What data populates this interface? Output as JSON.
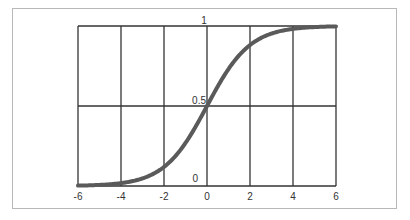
{
  "chart_data": {
    "type": "line",
    "title": "",
    "xlabel": "",
    "ylabel": "",
    "xlim": [
      -6,
      6
    ],
    "ylim": [
      0,
      1
    ],
    "grid": true,
    "x_ticks": [
      "-6",
      "-4",
      "-2",
      "0",
      "2",
      "4",
      "6"
    ],
    "y_ticks": [
      "0",
      "0.5",
      "1"
    ],
    "series": [
      {
        "name": "sigmoid",
        "function": "1/(1+exp(-x))",
        "x": [
          -6,
          -5,
          -4,
          -3,
          -2,
          -1,
          0,
          1,
          2,
          3,
          4,
          5,
          6
        ],
        "values": [
          0.002,
          0.007,
          0.018,
          0.047,
          0.119,
          0.269,
          0.5,
          0.731,
          0.881,
          0.953,
          0.982,
          0.993,
          0.998
        ]
      }
    ],
    "colors": {
      "curve": "#5a5a5a",
      "grid": "#333333",
      "frame": "#b8b8b8"
    }
  }
}
